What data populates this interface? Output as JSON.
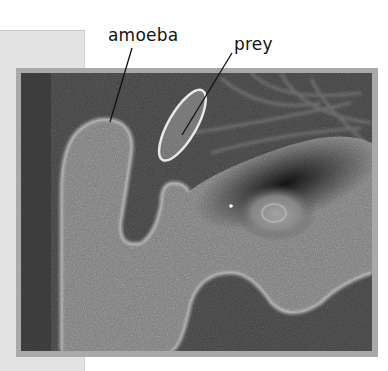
{
  "figure": {
    "type": "phase-contrast micrograph",
    "labels": [
      {
        "id": "amoeba",
        "text": "amoeba"
      },
      {
        "id": "prey",
        "text": "prey"
      }
    ]
  },
  "colors": {
    "background": "#ffffff",
    "side_panel": "#e3e3e3",
    "frame": "#a9a9a9",
    "label_text": "#111111",
    "leader_line": "#111111"
  }
}
